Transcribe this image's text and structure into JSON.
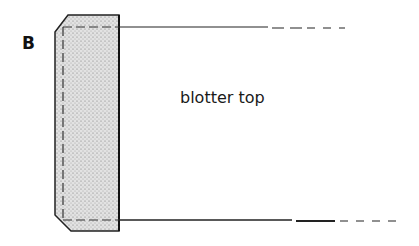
{
  "figure": {
    "panel_label": "B",
    "labels": [
      {
        "text": "blotter top"
      }
    ],
    "colors": {
      "line": "#222222",
      "stipple_fill": "#d9d9d9"
    }
  }
}
